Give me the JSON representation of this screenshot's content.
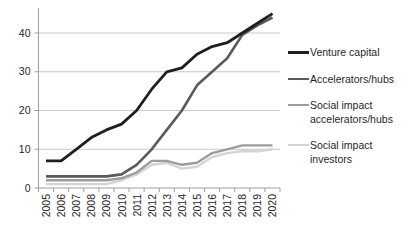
{
  "chart_data": {
    "type": "line",
    "title": "",
    "xlabel": "",
    "ylabel": "",
    "x": [
      2005,
      2006,
      2007,
      2008,
      2009,
      2010,
      2011,
      2012,
      2013,
      2014,
      2015,
      2016,
      2017,
      2018,
      2019,
      2020
    ],
    "yticks": [
      0,
      10,
      20,
      30,
      40
    ],
    "ylim": [
      0,
      46
    ],
    "grid": true,
    "legend_position": "right",
    "series": [
      {
        "name": "Venture capital",
        "color": "#1f1f1f",
        "width": 2.8,
        "values": [
          7,
          7,
          10,
          13,
          15,
          16.5,
          20,
          25.5,
          30,
          31,
          34.5,
          36.5,
          37.5,
          40,
          42.5,
          45
        ]
      },
      {
        "name": "Accelerators/hubs",
        "color": "#5a5a5a",
        "width": 2.6,
        "values": [
          3,
          3,
          3,
          3,
          3,
          3.5,
          6,
          10,
          15,
          20,
          26.5,
          30,
          33.5,
          39.5,
          42,
          44
        ]
      },
      {
        "name": "Social impact accelerators/hubs",
        "color": "#9c9c9c",
        "width": 2.4,
        "values": [
          2,
          2,
          2,
          2,
          2,
          2.5,
          4,
          7,
          7,
          6,
          6.5,
          9,
          10,
          11,
          11,
          11
        ]
      },
      {
        "name": "Social impact investors",
        "color": "#d4d4d4",
        "width": 2.4,
        "values": [
          1,
          1,
          1,
          1,
          1,
          2,
          3.5,
          6,
          6.5,
          5,
          5.5,
          8,
          9,
          9.5,
          9.5,
          10
        ]
      }
    ],
    "colors": {
      "gridline": "#c8c8c8",
      "axis": "#9e9e9e",
      "tick_label": "#262626"
    }
  }
}
